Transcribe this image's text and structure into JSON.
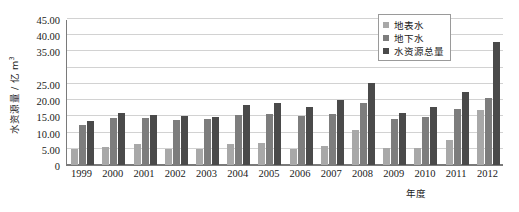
{
  "chart_data": {
    "type": "bar",
    "title": "",
    "subtitle": "",
    "xlabel": "年度",
    "ylabel": "水资源量 / 亿 m",
    "ylabel_superscript": "3",
    "ylim": [
      0,
      45
    ],
    "ytick_step": 5,
    "ytick_labels": [
      "0",
      "5.00",
      "10.00",
      "15.00",
      "20.00",
      "25.00",
      "",
      "35.00",
      "40.00",
      "45.00"
    ],
    "ytick_values": [
      0,
      5,
      10,
      15,
      20,
      25,
      30,
      35,
      40,
      45
    ],
    "grid": true,
    "legend_position": "top-right",
    "categories": [
      "1999",
      "2000",
      "2001",
      "2002",
      "2003",
      "2004",
      "2005",
      "2006",
      "2007",
      "2008",
      "2009",
      "2010",
      "2011",
      "2012"
    ],
    "series": [
      {
        "name": "地表水",
        "color": "#a8a8a8",
        "values": [
          4.8,
          5.7,
          6.6,
          4.9,
          4.9,
          6.6,
          6.7,
          5.0,
          6.0,
          10.9,
          5.2,
          5.2,
          7.6,
          16.9
        ]
      },
      {
        "name": "地下水",
        "color": "#7d7d7d",
        "values": [
          12.2,
          14.4,
          14.5,
          13.8,
          14.3,
          15.5,
          15.7,
          15.0,
          15.8,
          19.1,
          14.2,
          14.8,
          17.2,
          20.6
        ]
      },
      {
        "name": "水资源总量",
        "color": "#4a4a4a",
        "values": [
          13.6,
          16.0,
          15.5,
          15.1,
          14.9,
          18.5,
          19.0,
          17.8,
          19.9,
          25.3,
          15.9,
          17.9,
          22.4,
          37.8
        ]
      }
    ]
  },
  "legend": {
    "items": [
      {
        "label": "地表水"
      },
      {
        "label": "地下水"
      },
      {
        "label": "水资源总量"
      }
    ]
  }
}
